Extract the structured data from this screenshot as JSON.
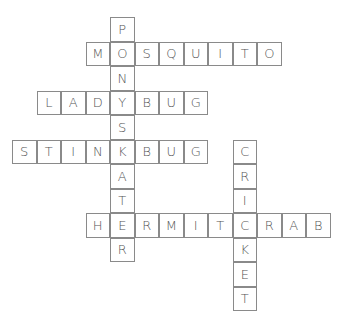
{
  "puzzle": {
    "cell_size": 24.5,
    "border_color": "#8a8a8a",
    "letter_color": "#555555",
    "words": [
      {
        "word": "PONDSKATER",
        "direction": "down",
        "row": 0,
        "col": 4
      },
      {
        "word": "MOSQUITO",
        "direction": "across",
        "row": 1,
        "col": 3
      },
      {
        "word": "LADYBUG",
        "direction": "across",
        "row": 3,
        "col": 1
      },
      {
        "word": "STINKBUG",
        "direction": "across",
        "row": 5,
        "col": 0
      },
      {
        "word": "CRICKET",
        "direction": "down",
        "row": 5,
        "col": 9
      },
      {
        "word": "HERMITCRAB",
        "direction": "across",
        "row": 8,
        "col": 3
      }
    ]
  }
}
